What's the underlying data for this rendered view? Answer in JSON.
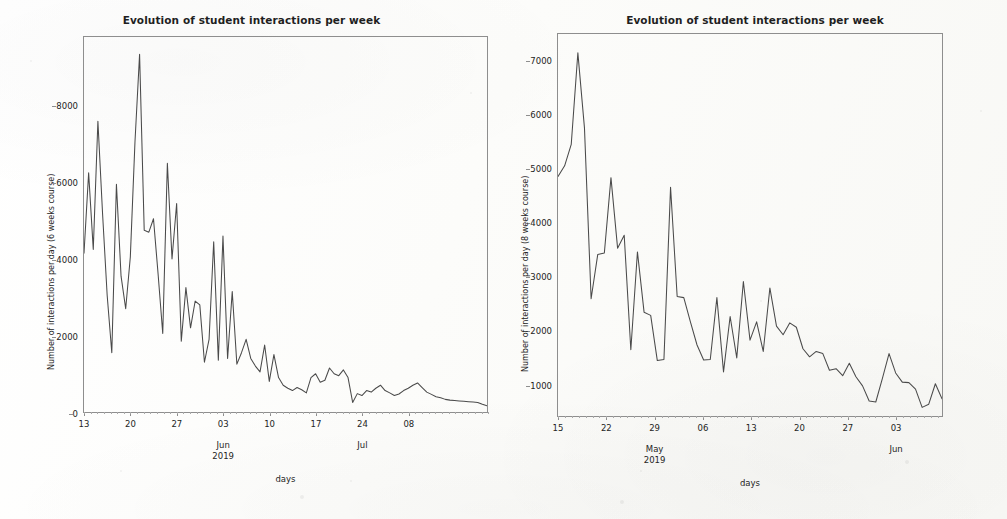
{
  "figure": {
    "background_color": "#fdfdfb",
    "line_color": "#4a4a4a",
    "axis_color": "#8e8e8e"
  },
  "chart_data": [
    {
      "id": "left",
      "type": "line",
      "title": "Evolution of student interactions per week",
      "xlabel": "days",
      "ylabel": "Number of interactions per day (6 weeks course)",
      "ylim": [
        0,
        9800
      ],
      "yticks": [
        0,
        2000,
        4000,
        6000,
        8000
      ],
      "ytick_labels": [
        "0",
        "2000",
        "4000",
        "6000",
        "8000"
      ],
      "xtick_labels": [
        "13",
        "20",
        "27",
        "03",
        "10",
        "17",
        "24",
        "08"
      ],
      "xgroup_labels": [
        {
          "line1": "Jun",
          "line2": "2019",
          "at_tick": "03"
        },
        {
          "line1": "Jul",
          "line2": "",
          "at_tick": "24"
        }
      ],
      "grid": false,
      "legend": "none",
      "x_start_date": "2019-05-13",
      "x": [
        0,
        1,
        2,
        3,
        4,
        5,
        6,
        7,
        8,
        9,
        10,
        11,
        12,
        13,
        14,
        15,
        16,
        17,
        18,
        19,
        20,
        21,
        22,
        23,
        24,
        25,
        26,
        27,
        28,
        29,
        30,
        31,
        32,
        33,
        34,
        35,
        36,
        37,
        38,
        39,
        40,
        41,
        42,
        43,
        44,
        45,
        46,
        47,
        48,
        49,
        50,
        51,
        52,
        53,
        54,
        55,
        56,
        57,
        58,
        59,
        60,
        61,
        62,
        63,
        64,
        65,
        66,
        67,
        68,
        69,
        70,
        71,
        72,
        73,
        74,
        75,
        76,
        77,
        78,
        79,
        80,
        81,
        82,
        83,
        84,
        85,
        86,
        87
      ],
      "values": [
        4150,
        6250,
        4250,
        7600,
        5200,
        3050,
        1550,
        5950,
        3550,
        2700,
        4050,
        7050,
        9350,
        4750,
        4700,
        5050,
        3600,
        2050,
        6500,
        4000,
        5450,
        1850,
        3250,
        2200,
        2900,
        2800,
        1300,
        1900,
        4450,
        1350,
        4600,
        1400,
        3150,
        1250,
        1550,
        1900,
        1400,
        1200,
        1050,
        1750,
        800,
        1500,
        900,
        700,
        620,
        560,
        640,
        580,
        500,
        900,
        1000,
        780,
        830,
        1150,
        1000,
        950,
        1100,
        900,
        250,
        480,
        430,
        560,
        520,
        620,
        700,
        560,
        500,
        430,
        470,
        560,
        620,
        700,
        760,
        640,
        520,
        460,
        400,
        370,
        330,
        310,
        300,
        290,
        280,
        270,
        260,
        250,
        200,
        160
      ]
    },
    {
      "id": "right",
      "type": "line",
      "title": "Evolution of student interactions per week",
      "xlabel": "days",
      "ylabel": "Number of interactions per day (8 weeks course)",
      "ylim": [
        400,
        7500
      ],
      "yticks": [
        1000,
        2000,
        3000,
        4000,
        5000,
        6000,
        7000
      ],
      "ytick_labels": [
        "1000",
        "2000",
        "3000",
        "4000",
        "5000",
        "6000",
        "7000"
      ],
      "xtick_labels": [
        "15",
        "22",
        "29",
        "06",
        "13",
        "20",
        "27",
        "03"
      ],
      "xgroup_labels": [
        {
          "line1": "May",
          "line2": "2019",
          "at_tick": "29"
        },
        {
          "line1": "Jun",
          "line2": "",
          "at_tick": "03"
        }
      ],
      "grid": false,
      "legend": "none",
      "x_start_date": "2019-04-15",
      "x": [
        0,
        1,
        2,
        3,
        4,
        5,
        6,
        7,
        8,
        9,
        10,
        11,
        12,
        13,
        14,
        15,
        16,
        17,
        18,
        19,
        20,
        21,
        22,
        23,
        24,
        25,
        26,
        27,
        28,
        29,
        30,
        31,
        32,
        33,
        34,
        35,
        36,
        37,
        38,
        39,
        40,
        41,
        42,
        43,
        44,
        45,
        46,
        47,
        48,
        49,
        50,
        51,
        52,
        53,
        54,
        55,
        56,
        57,
        58
      ],
      "values": [
        4850,
        5050,
        5450,
        7150,
        5750,
        2580,
        3400,
        3430,
        4830,
        3520,
        3760,
        1630,
        3450,
        2330,
        2270,
        1430,
        1450,
        4650,
        2620,
        2600,
        2150,
        1720,
        1440,
        1450,
        2600,
        1220,
        2250,
        1480,
        2900,
        1810,
        2150,
        1600,
        2780,
        2070,
        1910,
        2130,
        2050,
        1650,
        1500,
        1600,
        1560,
        1250,
        1280,
        1150,
        1380,
        1130,
        960,
        680,
        660,
        1100,
        1560,
        1200,
        1030,
        1020,
        900,
        560,
        620,
        1000,
        720
      ]
    }
  ]
}
